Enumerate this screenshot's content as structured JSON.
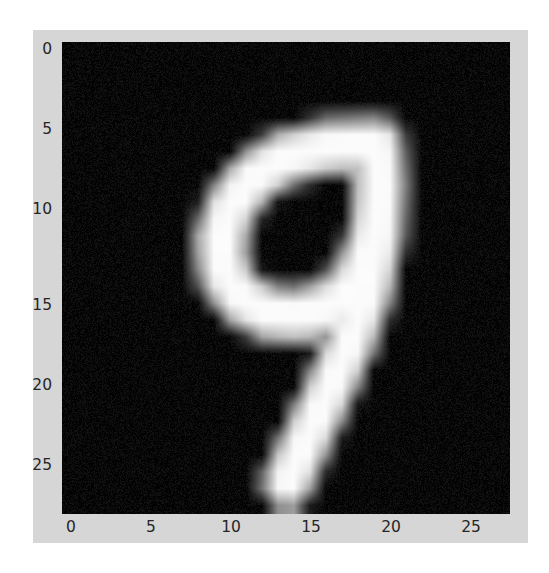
{
  "figure": {
    "background_color": "#ffffff",
    "figure_face_color": "#d6d6d6",
    "axes_background_color": "#070707"
  },
  "chart_data": {
    "type": "heatmap",
    "title": "",
    "subtitle": "",
    "xlabel": "",
    "ylabel": "",
    "colormap": "gray",
    "grid": false,
    "legend": false,
    "colorbar": false,
    "origin": "upper",
    "shape": [
      28,
      28
    ],
    "xlim": [
      -0.5,
      27.5
    ],
    "ylim": [
      27.5,
      -0.5
    ],
    "x_tick_labels": [
      "0",
      "5",
      "10",
      "15",
      "20",
      "25"
    ],
    "x_tick_values": [
      0,
      5,
      10,
      15,
      20,
      25
    ],
    "y_tick_labels": [
      "0",
      "5",
      "10",
      "15",
      "20",
      "25"
    ],
    "y_tick_values": [
      0,
      5,
      10,
      15,
      20,
      25
    ],
    "value_range": [
      0,
      255
    ],
    "depicted_digit": "9",
    "annotations": [],
    "strokes": [
      {
        "name": "loop",
        "description": "closed oval loop of the nine, slanted, upper portion of the glyph",
        "points_xy": [
          [
            19.2,
            5.6
          ],
          [
            16.0,
            5.3
          ],
          [
            13.0,
            6.0
          ],
          [
            11.0,
            7.4
          ],
          [
            9.6,
            9.2
          ],
          [
            9.0,
            11.4
          ],
          [
            9.2,
            13.4
          ],
          [
            10.3,
            15.0
          ],
          [
            12.2,
            16.0
          ],
          [
            14.6,
            16.2
          ],
          [
            16.8,
            15.4
          ],
          [
            18.2,
            14.0
          ],
          [
            19.0,
            12.0
          ],
          [
            19.4,
            9.6
          ],
          [
            19.5,
            7.4
          ],
          [
            19.2,
            5.6
          ]
        ]
      },
      {
        "name": "stem",
        "description": "descending tail of the nine from the right of the loop down to the baseline, curving slightly left",
        "points_xy": [
          [
            19.4,
            8.0
          ],
          [
            19.6,
            11.0
          ],
          [
            19.0,
            14.0
          ],
          [
            17.6,
            17.5
          ],
          [
            16.0,
            20.6
          ],
          [
            14.6,
            23.2
          ],
          [
            13.6,
            25.6
          ]
        ]
      }
    ]
  },
  "axis": {
    "x_ticks": [
      {
        "label": "0",
        "px": 71
      },
      {
        "label": "5",
        "px": 151
      },
      {
        "label": "10",
        "px": 231
      },
      {
        "label": "15",
        "px": 311
      },
      {
        "label": "20",
        "px": 391
      },
      {
        "label": "25",
        "px": 471
      }
    ],
    "y_ticks": [
      {
        "label": "0",
        "px": 50
      },
      {
        "label": "5",
        "px": 130
      },
      {
        "label": "10",
        "px": 210
      },
      {
        "label": "15",
        "px": 306
      },
      {
        "label": "20",
        "px": 386
      },
      {
        "label": "25",
        "px": 466
      }
    ]
  }
}
